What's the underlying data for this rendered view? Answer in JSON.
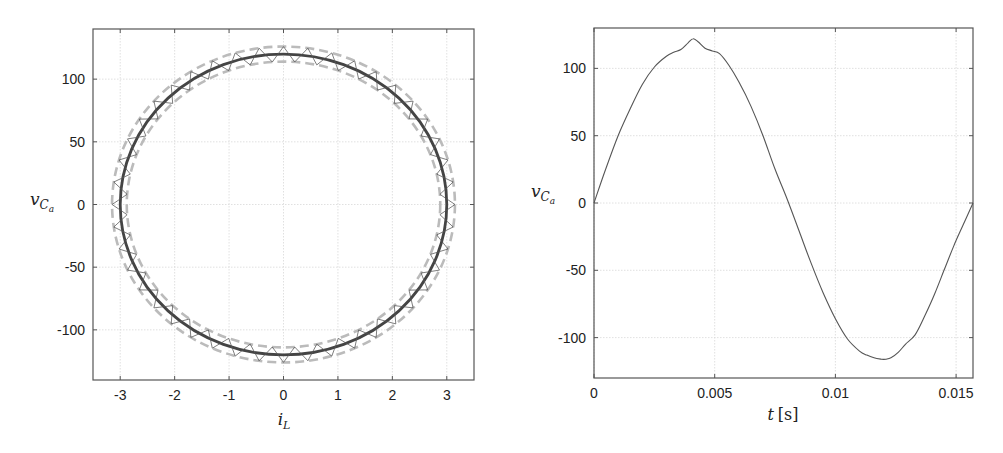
{
  "chart_data": [
    {
      "type": "line",
      "subtype": "phase-portrait",
      "title": "",
      "xlabel": "i_L",
      "ylabel": "v_{C_a}",
      "xlabel_display": {
        "main": "i",
        "sub": "L"
      },
      "ylabel_display": {
        "main": "v",
        "sub": "C",
        "subsub": "a"
      },
      "xlim": [
        -3.5,
        3.5
      ],
      "ylim": [
        -140,
        140
      ],
      "xticks": [
        -3,
        -2,
        -1,
        0,
        1,
        2,
        3
      ],
      "xtick_labels": [
        "-3",
        "-2",
        "-1",
        "0",
        "1",
        "2",
        "3"
      ],
      "yticks": [
        -100,
        -50,
        0,
        50,
        100
      ],
      "ytick_labels": [
        "-100",
        "-50",
        "0",
        "50",
        "100"
      ],
      "grid": true,
      "legend": null,
      "series": [
        {
          "name": "reference orbit",
          "style": "solid",
          "color": "#444444",
          "shape": "ellipse",
          "center": [
            0,
            0
          ],
          "radius_x": 3.0,
          "radius_y": 120
        },
        {
          "name": "upper band",
          "style": "dashed",
          "color": "#bbbbbb",
          "shape": "ellipse",
          "center": [
            0,
            0
          ],
          "radius_x": 3.15,
          "radius_y": 126
        },
        {
          "name": "lower band",
          "style": "dashed",
          "color": "#bbbbbb",
          "shape": "ellipse",
          "center": [
            0,
            0
          ],
          "radius_x": 2.88,
          "radius_y": 114
        },
        {
          "name": "switching trajectory",
          "style": "zigzag",
          "color": "#555555",
          "shape": "ellipse-zigzag",
          "center": [
            0,
            0
          ],
          "radius_x_range": [
            2.88,
            3.15
          ],
          "radius_y_range": [
            114,
            126
          ],
          "switch_count": 44
        }
      ]
    },
    {
      "type": "line",
      "title": "",
      "xlabel": "t [s]",
      "ylabel": "v_{C_a}",
      "xlabel_display": {
        "main": "t",
        "unit": "[s]"
      },
      "ylabel_display": {
        "main": "v",
        "sub": "C",
        "subsub": "a"
      },
      "xlim": [
        0,
        0.0157
      ],
      "ylim": [
        -130,
        130
      ],
      "xticks": [
        0,
        0.005,
        0.01,
        0.015
      ],
      "xtick_labels": [
        "0",
        "0.005",
        "0.01",
        "0.015"
      ],
      "yticks": [
        -100,
        -50,
        0,
        50,
        100
      ],
      "ytick_labels": [
        "-100",
        "-50",
        "0",
        "50",
        "100"
      ],
      "grid": true,
      "legend": null,
      "series": [
        {
          "name": "v_Ca(t)",
          "color": "#555555",
          "x": [
            0,
            0.0005,
            0.001,
            0.0015,
            0.002,
            0.0025,
            0.003,
            0.0033,
            0.0036,
            0.0039,
            0.0041,
            0.0043,
            0.0046,
            0.0049,
            0.0052,
            0.0056,
            0.006,
            0.0065,
            0.007,
            0.0075,
            0.008,
            0.0085,
            0.009,
            0.0095,
            0.01,
            0.0105,
            0.011,
            0.0113,
            0.0116,
            0.0119,
            0.0121,
            0.0123,
            0.0126,
            0.0129,
            0.0133,
            0.0137,
            0.0141,
            0.0145,
            0.0149,
            0.0153,
            0.0157
          ],
          "y": [
            0,
            26,
            50,
            70,
            88,
            101,
            109,
            112,
            114,
            119,
            122,
            120,
            115,
            113,
            111,
            102,
            90,
            72,
            50,
            25,
            3,
            -21,
            -45,
            -67,
            -86,
            -101,
            -110,
            -113,
            -115,
            -116,
            -116,
            -115,
            -111,
            -105,
            -98,
            -84,
            -68,
            -50,
            -32,
            -16,
            0
          ]
        }
      ]
    }
  ]
}
